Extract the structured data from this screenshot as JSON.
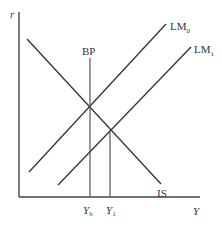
{
  "diagram": {
    "axes": {
      "y_label": "r",
      "x_label": "Y"
    },
    "curves": [
      {
        "name": "IS",
        "label": "IS",
        "slope": "downward"
      },
      {
        "name": "LM0",
        "label_main": "LM",
        "label_sub": "0",
        "slope": "upward"
      },
      {
        "name": "LM1",
        "label_main": "LM",
        "label_sub": "1",
        "slope": "upward"
      },
      {
        "name": "BP",
        "label": "BP",
        "slope": "vertical"
      }
    ],
    "x_ticks": [
      {
        "main": "Y",
        "sub": "b"
      },
      {
        "main": "Y",
        "sub": "1"
      }
    ],
    "colors": {
      "line": "#333333",
      "axis": "#444444",
      "background": "#ffffff"
    }
  }
}
